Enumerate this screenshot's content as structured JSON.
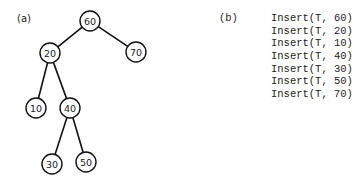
{
  "panel_a": {
    "label": "(a)",
    "tree": {
      "nodes": [
        {
          "id": "n60",
          "value": "60",
          "x": 90,
          "y": 21
        },
        {
          "id": "n20",
          "value": "20",
          "x": 50,
          "y": 53
        },
        {
          "id": "n70",
          "value": "70",
          "x": 136,
          "y": 52
        },
        {
          "id": "n10",
          "value": "10",
          "x": 36,
          "y": 108
        },
        {
          "id": "n40",
          "value": "40",
          "x": 70,
          "y": 108
        },
        {
          "id": "n30",
          "value": "30",
          "x": 52,
          "y": 164
        },
        {
          "id": "n50",
          "value": "50",
          "x": 86,
          "y": 162
        }
      ],
      "edges": [
        [
          "n60",
          "n20"
        ],
        [
          "n60",
          "n70"
        ],
        [
          "n20",
          "n10"
        ],
        [
          "n20",
          "n40"
        ],
        [
          "n40",
          "n30"
        ],
        [
          "n40",
          "n50"
        ]
      ]
    }
  },
  "panel_b": {
    "label": "(b)",
    "operations": [
      "Insert(T, 60)",
      "Insert(T, 20)",
      "Insert(T, 10)",
      "Insert(T, 40)",
      "Insert(T, 30)",
      "Insert(T, 50)",
      "Insert(T, 70)"
    ]
  }
}
